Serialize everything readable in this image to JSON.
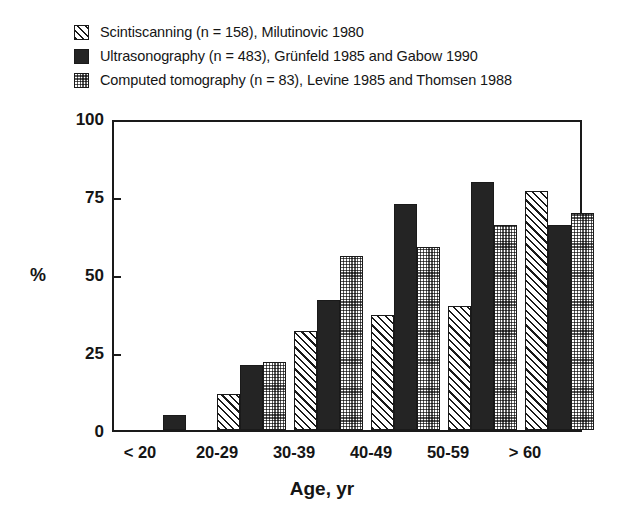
{
  "chart_data": {
    "type": "bar",
    "title": "",
    "xlabel": "Age, yr",
    "ylabel": "%",
    "ylim": [
      0,
      100
    ],
    "yticks": [
      0,
      25,
      50,
      75,
      100
    ],
    "grid": false,
    "legend_position": "top-left",
    "categories": [
      "< 20",
      "20-29",
      "30-39",
      "40-49",
      "50-59",
      "> 60"
    ],
    "series": [
      {
        "name": "Scintiscanning",
        "legend_label": "Scintiscanning (n = 158), Milutinovic 1980",
        "n": 158,
        "source": "Milutinovic 1980",
        "pattern": "diagonal-hatch",
        "values": [
          0,
          11.5,
          32,
          37,
          40,
          77
        ]
      },
      {
        "name": "Ultrasonography",
        "legend_label": "Ultrasonography (n = 483), Grünfeld 1985 and Gabow 1990",
        "n": 483,
        "source": "Grünfeld 1985 and Gabow 1990",
        "pattern": "dark-checker",
        "values": [
          5,
          21,
          42,
          73,
          80,
          66
        ]
      },
      {
        "name": "Computed tomography",
        "legend_label": "Computed tomography (n = 83), Levine 1985 and Thomsen 1988",
        "n": 83,
        "source": "Levine 1985 and Thomsen 1988",
        "pattern": "light-checker",
        "values": [
          0,
          22,
          56,
          59,
          66,
          70
        ]
      }
    ]
  },
  "legend": {
    "items": [
      {
        "label": "Scintiscanning (n = 158), Milutinovic 1980",
        "pattern": "diagonal-hatch"
      },
      {
        "label": "Ultrasonography (n = 483), Grünfeld 1985 and Gabow 1990",
        "pattern": "dark-checker"
      },
      {
        "label": "Computed tomography (n = 83), Levine 1985 and Thomsen 1988",
        "pattern": "light-checker"
      }
    ]
  },
  "axes": {
    "y": {
      "label": "%",
      "ticks": [
        "0",
        "25",
        "50",
        "75",
        "100"
      ]
    },
    "x": {
      "label": "Age, yr",
      "ticks": [
        "< 20",
        "20-29",
        "30-39",
        "40-49",
        "50-59",
        "> 60"
      ]
    }
  },
  "colors": {
    "axis": "#1a1a1a",
    "text": "#151515",
    "background": "#ffffff",
    "series_dark": "#242424",
    "series_light": "#ffffff"
  }
}
